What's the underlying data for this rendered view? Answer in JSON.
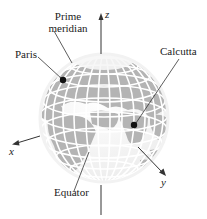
{
  "figure": {
    "labels": {
      "prime_meridian_line1": "Prime",
      "prime_meridian_line2": "meridian",
      "paris": "Paris",
      "calcutta": "Calcutta",
      "equator": "Equator"
    },
    "axes": {
      "x": "x",
      "y": "y",
      "z": "z"
    },
    "colors": {
      "land": "#b4b4b4",
      "ocean": "#f0f0f0",
      "grid": "#ffffff",
      "marker": "#111111",
      "leader": "#333333"
    }
  }
}
